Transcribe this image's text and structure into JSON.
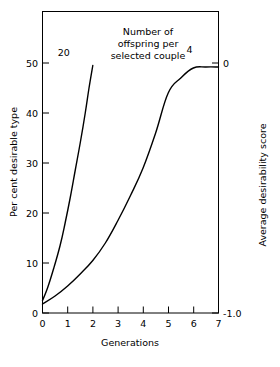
{
  "chart_data": {
    "type": "line",
    "title": "",
    "annotation": {
      "lines": [
        "Number of",
        "offspring per",
        "selected couple"
      ]
    },
    "xlabel": "Generations",
    "ylabel": "Per cent desirable type",
    "y2label": "Average desirability score",
    "xlim": [
      0,
      7
    ],
    "ylim": [
      0,
      56
    ],
    "y2lim": [
      -1.0,
      0.1
    ],
    "grid": false,
    "legend_position": "inline-curve-labels",
    "xticks": [
      "0",
      "1",
      "2",
      "3",
      "4",
      "5",
      "6",
      "7"
    ],
    "xtick_values": [
      0,
      1,
      2,
      3,
      4,
      5,
      6,
      7
    ],
    "yticks": [
      "0",
      "10",
      "20",
      "30",
      "40",
      "50"
    ],
    "ytick_values": [
      0,
      10,
      20,
      30,
      40,
      50
    ],
    "y2ticks": [
      "-1.0",
      "0"
    ],
    "y2tick_values": [
      -1.0,
      0.0
    ],
    "series": [
      {
        "name": "20",
        "label": "20",
        "label_x": 0.85,
        "label_y": 51.5,
        "x": [
          0,
          0.2,
          0.45,
          0.7,
          0.9,
          1.1,
          1.3,
          1.5,
          1.7,
          1.85,
          2.0
        ],
        "values": [
          2.5,
          5.0,
          9.0,
          13.5,
          18.0,
          23.0,
          28.5,
          34.0,
          40.0,
          45.0,
          49.5
        ]
      },
      {
        "name": "4",
        "label": "4",
        "label_x": 5.85,
        "label_y": 52.0,
        "x": [
          0,
          0.5,
          1.0,
          1.5,
          2.0,
          2.5,
          3.0,
          3.5,
          4.0,
          4.5,
          5.0,
          5.5,
          6.0,
          6.5,
          7.0
        ],
        "values": [
          1.8,
          3.4,
          5.4,
          7.8,
          10.5,
          14.0,
          18.5,
          23.5,
          29.0,
          36.0,
          44.0,
          47.0,
          49.0,
          49.2,
          49.2
        ]
      }
    ]
  },
  "figure": {
    "xlabel": "Generations",
    "ylabel": "Per cent desirable type",
    "y2label": "Average desirability score",
    "annotation_line1": "Number of",
    "annotation_line2": "offspring per",
    "annotation_line3": "selected couple",
    "series20_label": "20",
    "series4_label": "4",
    "ytick0": "0",
    "ytick10": "10",
    "ytick20": "20",
    "ytick30": "30",
    "ytick40": "40",
    "ytick50": "50",
    "xtick0": "0",
    "xtick1": "1",
    "xtick2": "2",
    "xtick3": "3",
    "xtick4": "4",
    "xtick5": "5",
    "xtick6": "6",
    "xtick7": "7",
    "y2tick_top": "0",
    "y2tick_bottom": "-1.0"
  },
  "colors": {
    "line": "#000000",
    "axis": "#000000",
    "background": "#ffffff"
  }
}
